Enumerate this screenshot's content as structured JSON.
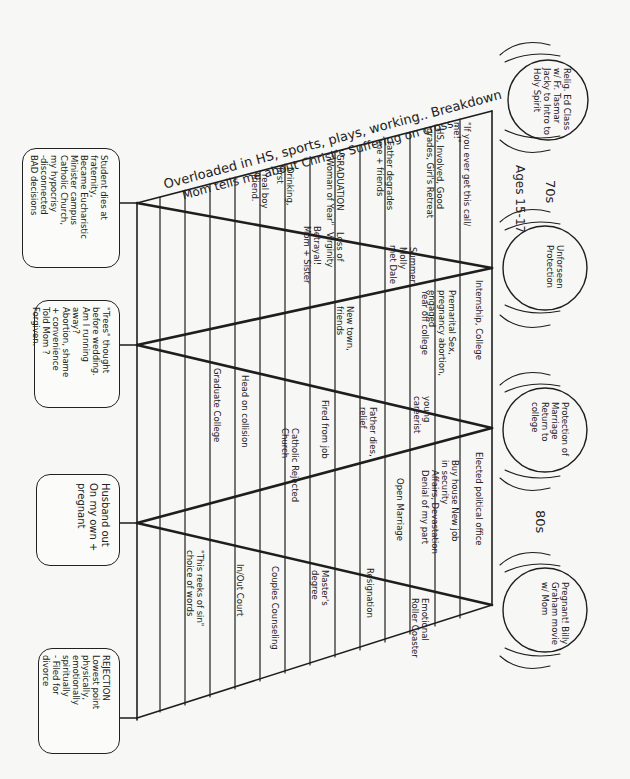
{
  "diagram": {
    "type": "hand-drawn life timeline with zig-zag turning points",
    "orientation": "rotated 90 degrees clockwise",
    "top_caption": {
      "line1": "Overloaded in HS, sports, plays, working.. Breakdown",
      "line2": "Mom tells me about Christ's Suffering on cross."
    },
    "decade_labels": {
      "seventies": "70s",
      "eighties": "80s",
      "ages": "Ages 15-17"
    },
    "hand_circles": [
      {
        "id": "religious-ed",
        "text": "Relig. Ed Class w/ Fr. Tasmar Jacky to Intro to Holy Spirit"
      },
      {
        "id": "unforeseen-protection",
        "text": "Unforseen Protection"
      },
      {
        "id": "protection-of-marriage",
        "text": "Protection of Marriage Return to college"
      },
      {
        "id": "pregnant-billy-graham",
        "text": "Pregnant! Billy Graham movie w/ Mom"
      }
    ],
    "left_boxes": [
      {
        "id": "student-dies",
        "text": "Student dies at fraternity,\nBecame Eucharistic\nMinister campus\nCatholic Church,\nmy hypocrisy\n-disconnected\nBAD decisions"
      },
      {
        "id": "trees-thought",
        "text": "\"Trees\" thought\nbefore wedding.\nAm I running\naway?\nAbortion, shame\n+ convenience\nTold Mom ?\nForgiven."
      },
      {
        "id": "husband-out",
        "text": "Husband out\nOn my own +\npregnant"
      },
      {
        "id": "rejection",
        "text": "REJECTION\nLowest point\nphysically,\nemotionally\nspiritually\n- Filed for\ndivorce"
      }
    ],
    "segments": [
      {
        "id": "segment-1",
        "entries": [
          "\"If you ever get this call/ me!\"",
          "HS, Involved, Good grades, Girl's Retreat",
          "Father degrades me + friends",
          "GRADUATION \"Woman of Year\"",
          "Drinking, first",
          "real boy friend."
        ]
      },
      {
        "id": "segment-2",
        "entries": [
          "Internship, College",
          "Premarital Sex, pregnancy abortion, engaged",
          "Year off college",
          "Summer Molly",
          "met Dale",
          "Loss of Virginity",
          "Betrayal! Mom + Sister",
          "New town, friends"
        ]
      },
      {
        "id": "segment-3",
        "entries": [
          "Elected political office",
          "Buy house New job in security",
          "young careerist",
          "Father dies, relief",
          "Fired from job",
          "Catholic Rejected Church",
          "Head on collision",
          "Graduate College"
        ]
      },
      {
        "id": "segment-4",
        "entries": [
          "Affairs, Devastation Denial of my part",
          "Open Marriage",
          "Emotional Roller Coaster",
          "Resignation",
          "Master's degree",
          "Couples Counseling",
          "In/Out Court",
          "\"This reeks of sin\" choice of words"
        ]
      }
    ]
  }
}
